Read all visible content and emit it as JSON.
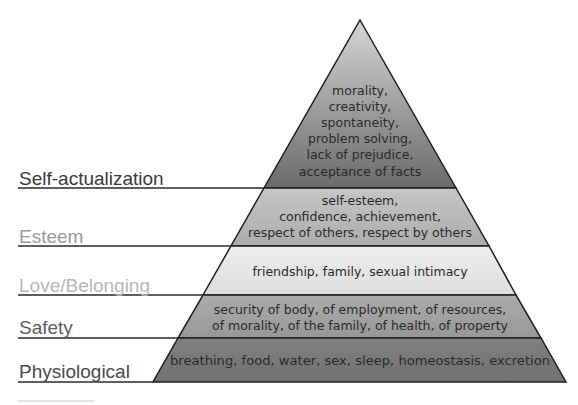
{
  "diagram": {
    "type": "pyramid",
    "levels": [
      {
        "name": "Self-actualization",
        "label_color": "#3a3a3a",
        "fill_top": "#d8d8d8",
        "fill_bottom": "#6e6e6e",
        "lines": [
          "morality,",
          "creativity,",
          "spontaneity,",
          "problem solving,",
          "lack of prejudice,",
          "acceptance of facts"
        ]
      },
      {
        "name": "Esteem",
        "label_color": "#9a9a9a",
        "fill_top": "#c4c4c4",
        "fill_bottom": "#b0b0b0",
        "lines": [
          "self-esteem,",
          "confidence, achievement,",
          "respect of others, respect by others"
        ]
      },
      {
        "name": "Love/Belonging",
        "label_color": "#b8b8b8",
        "fill_top": "#ececec",
        "fill_bottom": "#e0e0e0",
        "lines": [
          "friendship, family, sexual intimacy"
        ]
      },
      {
        "name": "Safety",
        "label_color": "#5e5e5e",
        "fill_top": "#a8a8a8",
        "fill_bottom": "#9a9a9a",
        "lines": [
          "security of body, of employment, of resources,",
          "of morality, of the family, of health, of property"
        ]
      },
      {
        "name": "Physiological",
        "label_color": "#4a4a4a",
        "fill_top": "#7e7e7e",
        "fill_bottom": "#727272",
        "lines": [
          "breathing, food, water, sex, sleep, homeostasis, excretion"
        ]
      }
    ],
    "outline_color": "#1e1e1e"
  }
}
